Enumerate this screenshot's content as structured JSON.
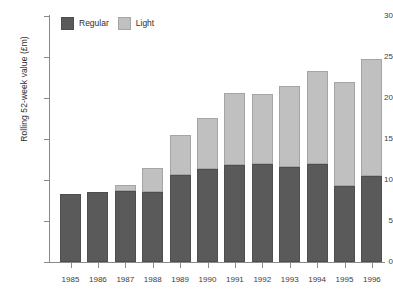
{
  "chart_data": {
    "type": "bar",
    "title": "",
    "subtitle": "",
    "xlabel": "",
    "ylabel": "Rolling 52-week value (£m)",
    "stacked": true,
    "grid": false,
    "legend_position": "top-left",
    "ylim": [
      0,
      30
    ],
    "yticks": [
      0,
      5,
      10,
      15,
      20,
      25,
      30
    ],
    "ytick_labels": [
      "0",
      "5",
      "10",
      "15",
      "20",
      "25",
      "30"
    ],
    "categories": [
      "1985",
      "1986",
      "1987",
      "1988",
      "1989",
      "1990",
      "1991",
      "1992",
      "1993",
      "1994",
      "1995",
      "1996"
    ],
    "series": [
      {
        "name": "Regular",
        "color": "#5a5a5a",
        "values": [
          8.3,
          8.5,
          8.7,
          8.5,
          10.6,
          11.3,
          11.8,
          11.9,
          11.6,
          11.9,
          9.3,
          10.5
        ]
      },
      {
        "name": "Light",
        "color": "#c0c0c0",
        "values": [
          0,
          0,
          0.7,
          3.0,
          4.9,
          6.3,
          8.8,
          8.6,
          9.9,
          11.4,
          12.7,
          14.3
        ]
      }
    ],
    "totals": [
      8.3,
      8.5,
      9.4,
      11.5,
      15.5,
      17.6,
      20.6,
      20.5,
      21.5,
      23.3,
      22.0,
      24.8
    ]
  },
  "legend": {
    "items": [
      {
        "label": "Regular",
        "color": "#5a5a5a"
      },
      {
        "label": "Light",
        "color": "#c0c0c0"
      }
    ]
  },
  "colors": {
    "regular": "#5a5a5a",
    "light": "#c0c0c0",
    "axis": "#8a8a8a",
    "text": "#2e2e2e",
    "background": "#ffffff"
  }
}
